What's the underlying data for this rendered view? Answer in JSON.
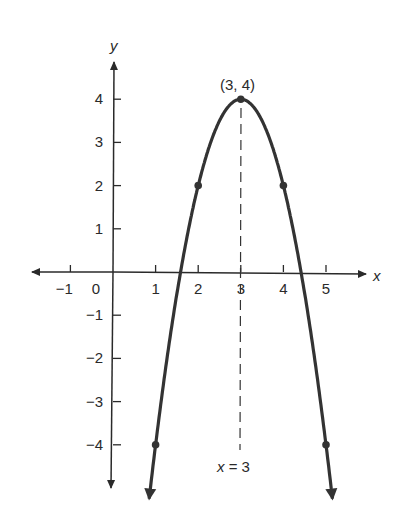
{
  "chart_data": {
    "type": "line",
    "title": "",
    "equation": "y = -2(x - 3)^2 + 4",
    "xlabel": "x",
    "ylabel": "y",
    "xlim": [
      -1.8,
      6
    ],
    "ylim": [
      -5,
      4.8
    ],
    "grid": false,
    "x_ticks": [
      -1,
      0,
      1,
      2,
      3,
      4,
      5
    ],
    "x_tick_labels": [
      "−1",
      "0",
      "1",
      "2",
      "3",
      "4",
      "5"
    ],
    "y_ticks": [
      4,
      3,
      2,
      1,
      -1,
      -2,
      -3,
      -4
    ],
    "y_tick_labels": [
      "4",
      "3",
      "2",
      "1",
      "−1",
      "−2",
      "−3",
      "−4"
    ],
    "points": [
      {
        "x": 1,
        "y": -4
      },
      {
        "x": 2,
        "y": 2
      },
      {
        "x": 3,
        "y": 4
      },
      {
        "x": 4,
        "y": 2
      },
      {
        "x": 5,
        "y": -4
      }
    ],
    "vertex": {
      "x": 3,
      "y": 4,
      "label": "(3, 4)"
    },
    "axis_of_symmetry": {
      "x": 3,
      "label": "x = 3",
      "style": "dashed"
    },
    "curve_color": "#333333"
  },
  "labels": {
    "x_axis": "x",
    "y_axis": "y",
    "vertex": "(3, 4)",
    "symmetry": "x = 3",
    "symmetry_x": "x",
    "symmetry_eq": " = 3"
  }
}
